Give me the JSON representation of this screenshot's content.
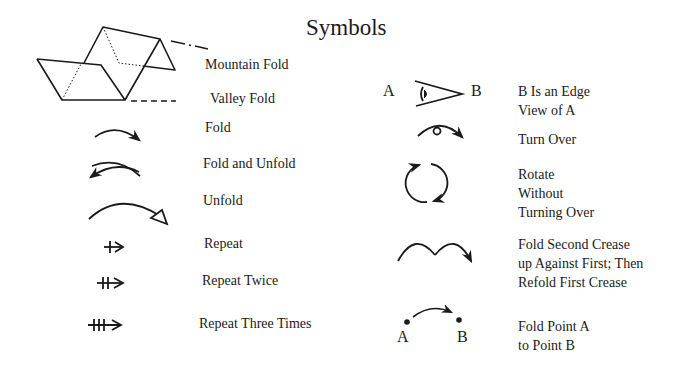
{
  "title": "Symbols",
  "left_column": {
    "mountain_fold": "Mountain Fold",
    "valley_fold": "Valley Fold",
    "fold": "Fold",
    "fold_and_unfold": "Fold and Unfold",
    "unfold": "Unfold",
    "repeat": "Repeat",
    "repeat_twice": "Repeat Twice",
    "repeat_three_times": "Repeat Three Times"
  },
  "right_column": {
    "edge_view": {
      "label_a": "A",
      "label_b": "B",
      "lines": [
        "B Is an Edge",
        "View of A"
      ]
    },
    "turn_over": "Turn Over",
    "rotate": {
      "lines": [
        "Rotate",
        "Without",
        "Turning Over"
      ]
    },
    "fold_second_crease": {
      "lines": [
        "Fold Second Crease",
        "up Against First; Then",
        "Refold First Crease"
      ]
    },
    "fold_point": {
      "label_a": "A",
      "label_b": "B",
      "lines": [
        "Fold Point A",
        "to Point B"
      ]
    }
  },
  "icons": {
    "mountain_valley": "folded-paper-diagram-icon",
    "fold": "fold-arrow-icon",
    "fold_and_unfold": "fold-unfold-arrow-icon",
    "unfold": "unfold-arrow-icon",
    "repeat": "repeat-arrow-icon",
    "repeat_twice": "repeat-twice-arrow-icon",
    "repeat_three_times": "repeat-three-times-arrow-icon",
    "edge_view": "edge-view-icon",
    "turn_over": "turn-over-icon",
    "rotate": "rotate-icon",
    "fold_second_crease": "double-fold-arrow-icon",
    "fold_point": "fold-point-arrow-icon"
  },
  "colors": {
    "ink": "#1a1a1a",
    "background": "#ffffff"
  }
}
